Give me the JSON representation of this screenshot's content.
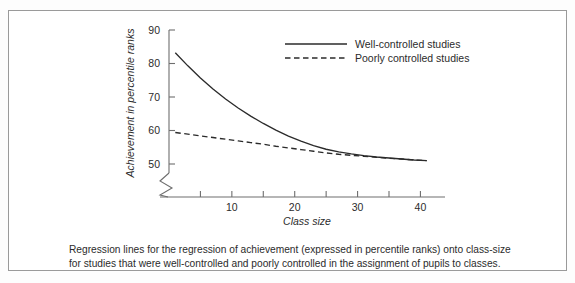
{
  "figure": {
    "caption_lines": [
      "Regression lines for the regression of achievement (expressed in percentile ranks) onto class-size",
      "for studies that were well-controlled and poorly controlled in the assignment of pupils to classes."
    ]
  },
  "chart_data": {
    "type": "line",
    "title": "",
    "xlabel": "Class size",
    "ylabel": "Achievement in percentile ranks",
    "xlim": [
      0,
      42
    ],
    "ylim": [
      46,
      92
    ],
    "grid": false,
    "axis_break": true,
    "legend_position": "top-right",
    "xticks": [
      5,
      10,
      15,
      20,
      25,
      30,
      35,
      40
    ],
    "xtick_labels": [
      "",
      "10",
      "",
      "20",
      "",
      "30",
      "",
      "40"
    ],
    "yticks": [
      50,
      60,
      70,
      80,
      90
    ],
    "ytick_labels": [
      "50",
      "60",
      "70",
      "80",
      "90"
    ],
    "series": [
      {
        "name": "Well-controlled studies",
        "style": "solid",
        "color": "#2b2b2b",
        "x": [
          1,
          3,
          5,
          7,
          9,
          11,
          13,
          15,
          17,
          19,
          21,
          23,
          25,
          27,
          29,
          31,
          33,
          35,
          37,
          39,
          41
        ],
        "y": [
          83.2,
          79.3,
          75.7,
          72.4,
          69.4,
          66.7,
          64.3,
          62.1,
          60.1,
          58.3,
          56.8,
          55.5,
          54.4,
          53.6,
          53.0,
          52.5,
          52.1,
          51.8,
          51.5,
          51.2,
          51.0
        ]
      },
      {
        "name": "Poorly controlled studies",
        "style": "dashed",
        "color": "#2b2b2b",
        "x": [
          1,
          3,
          5,
          7,
          9,
          11,
          13,
          15,
          17,
          19,
          21,
          23,
          25,
          27,
          29,
          31,
          33,
          35,
          37,
          39,
          41
        ],
        "y": [
          59.4,
          58.9,
          58.4,
          57.9,
          57.4,
          56.9,
          56.4,
          55.9,
          55.3,
          54.8,
          54.3,
          53.8,
          53.3,
          52.9,
          52.6,
          52.3,
          52.0,
          51.7,
          51.5,
          51.2,
          51.0
        ]
      }
    ]
  }
}
